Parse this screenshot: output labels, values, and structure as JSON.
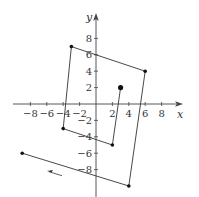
{
  "chart_data": {
    "type": "line",
    "title": "",
    "xlabel": "x",
    "ylabel": "y",
    "xlim": [
      -10,
      10.5
    ],
    "ylim": [
      -11,
      11
    ],
    "grid": false,
    "x_ticks": [
      -8,
      -6,
      -4,
      -2,
      2,
      4,
      6,
      8
    ],
    "x_tick_labels": [
      "−8",
      "−6",
      "−4",
      "−2",
      "2",
      "4",
      "6",
      "8"
    ],
    "y_ticks": [
      8,
      6,
      4,
      2,
      -2,
      -4,
      -6,
      -8
    ],
    "y_tick_labels": [
      "8",
      "6",
      "4",
      "2",
      "−2",
      "−4",
      "−6",
      "−8"
    ],
    "series": [
      {
        "name": "path",
        "points": [
          [
            3,
            2
          ],
          [
            2,
            -5
          ],
          [
            -4,
            -3
          ],
          [
            -3,
            7
          ],
          [
            6,
            4
          ],
          [
            4,
            -10
          ],
          [
            -9,
            -6
          ]
        ],
        "start_point": [
          3,
          2
        ],
        "direction_arrow": "left"
      }
    ],
    "annotations": [
      {
        "type": "arrow",
        "direction": "left",
        "near": [
          -5,
          -8.5
        ]
      }
    ]
  },
  "colors": {
    "line": "#333333",
    "axis": "#444444",
    "background": "#ffffff"
  }
}
